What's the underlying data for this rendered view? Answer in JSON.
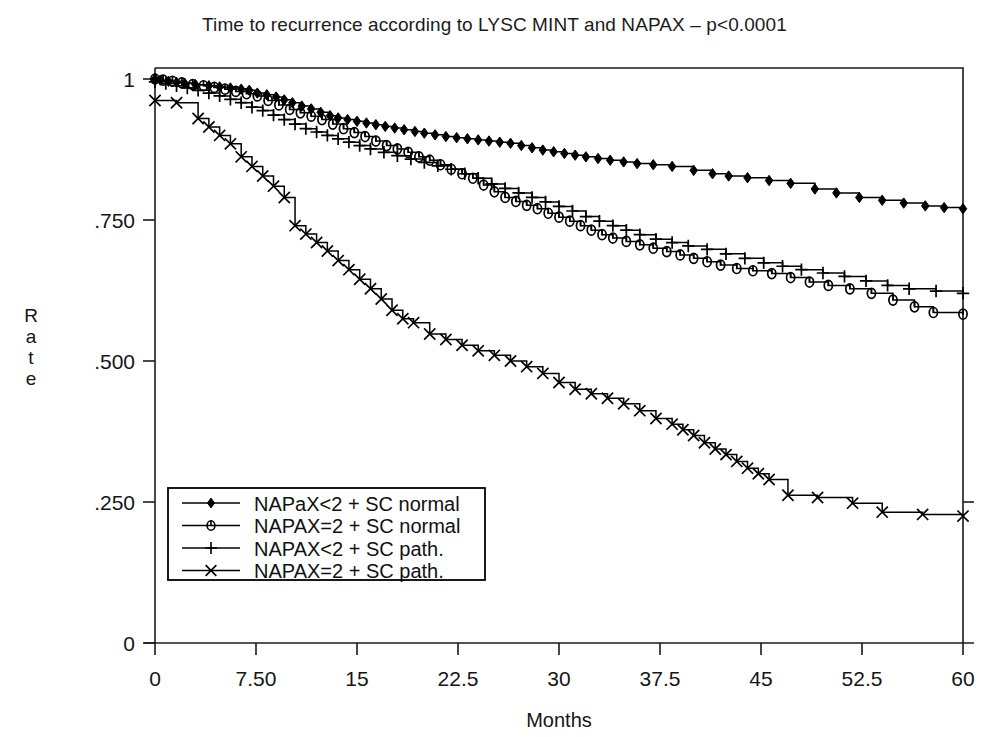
{
  "chart_data": {
    "type": "line",
    "title": "Time to recurrence according to LYSC MINT and NAPAX – p<0.0001",
    "xlabel": "Months",
    "ylabel": "Rate",
    "xlim": [
      0,
      60
    ],
    "ylim": [
      0,
      1
    ],
    "grid": false,
    "legend_position": "lower-left-inside",
    "x_ticks": [
      "0",
      "7.50",
      "15",
      "22.5",
      "30",
      "37.5",
      "45",
      "52.5",
      "60"
    ],
    "x_tick_values": [
      0,
      7.5,
      15,
      22.5,
      30,
      37.5,
      45,
      52.5,
      60
    ],
    "y_ticks": [
      "0",
      ".250",
      ".500",
      ".750",
      "1"
    ],
    "y_tick_values": [
      0,
      0.25,
      0.5,
      0.75,
      1
    ],
    "note": "Kaplan-Meier step curves; markers denote censored observations",
    "series": [
      {
        "name": "NAPaX<2 + SC normal",
        "marker": "filled-diamond",
        "points": [
          [
            0,
            1.0
          ],
          [
            0.4,
            0.998
          ],
          [
            1.0,
            0.996
          ],
          [
            1.6,
            0.994
          ],
          [
            2.2,
            0.992
          ],
          [
            3.0,
            0.99
          ],
          [
            4.0,
            0.988
          ],
          [
            4.8,
            0.986
          ],
          [
            5.6,
            0.984
          ],
          [
            6.4,
            0.982
          ],
          [
            7.0,
            0.98
          ],
          [
            7.6,
            0.975
          ],
          [
            8.3,
            0.972
          ],
          [
            9.0,
            0.968
          ],
          [
            9.6,
            0.963
          ],
          [
            10.2,
            0.958
          ],
          [
            10.9,
            0.952
          ],
          [
            11.6,
            0.947
          ],
          [
            12.3,
            0.941
          ],
          [
            13.0,
            0.935
          ],
          [
            13.6,
            0.931
          ],
          [
            14.3,
            0.928
          ],
          [
            15.0,
            0.925
          ],
          [
            15.7,
            0.922
          ],
          [
            16.4,
            0.919
          ],
          [
            17.1,
            0.916
          ],
          [
            17.8,
            0.913
          ],
          [
            18.5,
            0.91
          ],
          [
            19.3,
            0.907
          ],
          [
            20.0,
            0.904
          ],
          [
            20.8,
            0.901
          ],
          [
            21.6,
            0.898
          ],
          [
            22.4,
            0.896
          ],
          [
            23.2,
            0.894
          ],
          [
            24.0,
            0.892
          ],
          [
            24.8,
            0.89
          ],
          [
            25.6,
            0.888
          ],
          [
            26.4,
            0.886
          ],
          [
            27.2,
            0.882
          ],
          [
            28.0,
            0.878
          ],
          [
            28.8,
            0.874
          ],
          [
            29.6,
            0.871
          ],
          [
            30.4,
            0.868
          ],
          [
            31.2,
            0.865
          ],
          [
            32.0,
            0.862
          ],
          [
            32.9,
            0.859
          ],
          [
            33.8,
            0.856
          ],
          [
            34.8,
            0.853
          ],
          [
            35.8,
            0.85
          ],
          [
            37.0,
            0.848
          ],
          [
            38.4,
            0.845
          ],
          [
            40.0,
            0.838
          ],
          [
            41.4,
            0.832
          ],
          [
            42.6,
            0.828
          ],
          [
            44.0,
            0.825
          ],
          [
            45.6,
            0.82
          ],
          [
            47.2,
            0.815
          ],
          [
            49.0,
            0.805
          ],
          [
            50.6,
            0.798
          ],
          [
            52.3,
            0.79
          ],
          [
            54.0,
            0.785
          ],
          [
            55.6,
            0.78
          ],
          [
            57.2,
            0.775
          ],
          [
            58.6,
            0.772
          ],
          [
            60.0,
            0.77
          ]
        ]
      },
      {
        "name": "NAPAX=2 + SC normal",
        "marker": "circle-bar",
        "points": [
          [
            0,
            1.0
          ],
          [
            0.6,
            0.998
          ],
          [
            1.3,
            0.996
          ],
          [
            2.0,
            0.993
          ],
          [
            2.8,
            0.99
          ],
          [
            3.6,
            0.988
          ],
          [
            4.4,
            0.985
          ],
          [
            5.2,
            0.982
          ],
          [
            6.0,
            0.978
          ],
          [
            6.8,
            0.974
          ],
          [
            7.6,
            0.97
          ],
          [
            8.4,
            0.962
          ],
          [
            9.2,
            0.954
          ],
          [
            10.0,
            0.946
          ],
          [
            10.8,
            0.94
          ],
          [
            11.6,
            0.934
          ],
          [
            12.4,
            0.928
          ],
          [
            13.2,
            0.92
          ],
          [
            14.0,
            0.912
          ],
          [
            14.8,
            0.905
          ],
          [
            15.6,
            0.898
          ],
          [
            16.4,
            0.89
          ],
          [
            17.2,
            0.882
          ],
          [
            18.0,
            0.876
          ],
          [
            18.8,
            0.87
          ],
          [
            19.6,
            0.862
          ],
          [
            20.4,
            0.856
          ],
          [
            21.2,
            0.848
          ],
          [
            22.0,
            0.84
          ],
          [
            22.8,
            0.832
          ],
          [
            23.6,
            0.824
          ],
          [
            24.4,
            0.812
          ],
          [
            25.2,
            0.8
          ],
          [
            26.0,
            0.79
          ],
          [
            26.8,
            0.783
          ],
          [
            27.6,
            0.776
          ],
          [
            28.4,
            0.77
          ],
          [
            29.2,
            0.762
          ],
          [
            30.0,
            0.755
          ],
          [
            30.8,
            0.748
          ],
          [
            31.6,
            0.74
          ],
          [
            32.4,
            0.732
          ],
          [
            33.2,
            0.724
          ],
          [
            34.0,
            0.718
          ],
          [
            35.0,
            0.712
          ],
          [
            36.0,
            0.706
          ],
          [
            37.0,
            0.7
          ],
          [
            38.0,
            0.694
          ],
          [
            39.0,
            0.688
          ],
          [
            40.0,
            0.682
          ],
          [
            41.0,
            0.676
          ],
          [
            42.0,
            0.67
          ],
          [
            43.2,
            0.664
          ],
          [
            44.4,
            0.66
          ],
          [
            45.8,
            0.655
          ],
          [
            47.2,
            0.648
          ],
          [
            48.6,
            0.64
          ],
          [
            50.0,
            0.634
          ],
          [
            51.6,
            0.628
          ],
          [
            53.2,
            0.62
          ],
          [
            54.8,
            0.608
          ],
          [
            56.4,
            0.596
          ],
          [
            57.8,
            0.586
          ],
          [
            60.0,
            0.583
          ]
        ]
      },
      {
        "name": "NAPAX<2 + SC path.",
        "marker": "plus",
        "points": [
          [
            0,
            0.995
          ],
          [
            0.8,
            0.992
          ],
          [
            1.6,
            0.988
          ],
          [
            2.4,
            0.984
          ],
          [
            3.2,
            0.98
          ],
          [
            4.0,
            0.975
          ],
          [
            4.8,
            0.97
          ],
          [
            5.6,
            0.964
          ],
          [
            6.4,
            0.958
          ],
          [
            7.2,
            0.95
          ],
          [
            8.0,
            0.944
          ],
          [
            8.8,
            0.936
          ],
          [
            9.6,
            0.928
          ],
          [
            10.4,
            0.92
          ],
          [
            11.2,
            0.912
          ],
          [
            12.0,
            0.906
          ],
          [
            12.8,
            0.9
          ],
          [
            13.6,
            0.894
          ],
          [
            14.4,
            0.888
          ],
          [
            15.2,
            0.882
          ],
          [
            16.0,
            0.876
          ],
          [
            17.0,
            0.87
          ],
          [
            18.0,
            0.864
          ],
          [
            19.0,
            0.858
          ],
          [
            20.0,
            0.852
          ],
          [
            21.0,
            0.846
          ],
          [
            22.0,
            0.84
          ],
          [
            23.0,
            0.832
          ],
          [
            24.0,
            0.824
          ],
          [
            25.0,
            0.814
          ],
          [
            26.0,
            0.806
          ],
          [
            27.0,
            0.798
          ],
          [
            28.0,
            0.79
          ],
          [
            29.0,
            0.782
          ],
          [
            30.0,
            0.774
          ],
          [
            31.0,
            0.766
          ],
          [
            32.0,
            0.756
          ],
          [
            33.0,
            0.748
          ],
          [
            34.0,
            0.74
          ],
          [
            35.0,
            0.732
          ],
          [
            36.0,
            0.724
          ],
          [
            37.2,
            0.716
          ],
          [
            38.4,
            0.71
          ],
          [
            39.6,
            0.704
          ],
          [
            41.0,
            0.698
          ],
          [
            42.4,
            0.69
          ],
          [
            43.8,
            0.682
          ],
          [
            45.2,
            0.674
          ],
          [
            46.6,
            0.668
          ],
          [
            48.0,
            0.662
          ],
          [
            49.6,
            0.656
          ],
          [
            51.2,
            0.65
          ],
          [
            52.8,
            0.642
          ],
          [
            54.4,
            0.634
          ],
          [
            56.0,
            0.628
          ],
          [
            58.0,
            0.624
          ],
          [
            60.0,
            0.62
          ]
        ]
      },
      {
        "name": "NAPAX=2 + SC path.",
        "marker": "x",
        "points": [
          [
            0,
            0.962
          ],
          [
            1.6,
            0.958
          ],
          [
            3.2,
            0.93
          ],
          [
            4.0,
            0.915
          ],
          [
            4.8,
            0.9
          ],
          [
            5.6,
            0.885
          ],
          [
            6.4,
            0.862
          ],
          [
            7.2,
            0.845
          ],
          [
            8.0,
            0.828
          ],
          [
            8.8,
            0.81
          ],
          [
            9.6,
            0.79
          ],
          [
            10.4,
            0.74
          ],
          [
            11.2,
            0.725
          ],
          [
            12.0,
            0.71
          ],
          [
            12.8,
            0.695
          ],
          [
            13.6,
            0.678
          ],
          [
            14.4,
            0.662
          ],
          [
            15.2,
            0.645
          ],
          [
            16.0,
            0.628
          ],
          [
            16.8,
            0.61
          ],
          [
            17.6,
            0.59
          ],
          [
            18.4,
            0.575
          ],
          [
            19.2,
            0.568
          ],
          [
            20.4,
            0.548
          ],
          [
            21.6,
            0.538
          ],
          [
            22.8,
            0.528
          ],
          [
            24.0,
            0.518
          ],
          [
            25.2,
            0.51
          ],
          [
            26.4,
            0.5
          ],
          [
            27.6,
            0.49
          ],
          [
            28.8,
            0.478
          ],
          [
            30.0,
            0.462
          ],
          [
            31.2,
            0.45
          ],
          [
            32.4,
            0.442
          ],
          [
            33.6,
            0.434
          ],
          [
            34.8,
            0.424
          ],
          [
            36.0,
            0.412
          ],
          [
            37.2,
            0.398
          ],
          [
            38.4,
            0.388
          ],
          [
            39.2,
            0.378
          ],
          [
            40.0,
            0.368
          ],
          [
            40.8,
            0.355
          ],
          [
            41.6,
            0.344
          ],
          [
            42.4,
            0.334
          ],
          [
            43.2,
            0.322
          ],
          [
            44.0,
            0.31
          ],
          [
            44.8,
            0.3
          ],
          [
            45.6,
            0.29
          ],
          [
            47.0,
            0.262
          ],
          [
            49.2,
            0.258
          ],
          [
            51.8,
            0.248
          ],
          [
            54.0,
            0.232
          ],
          [
            57.0,
            0.228
          ],
          [
            60.0,
            0.225
          ]
        ]
      }
    ],
    "legend": [
      {
        "label": "NAPaX<2 + SC normal",
        "marker": "filled-diamond"
      },
      {
        "label": "NAPAX=2 + SC normal",
        "marker": "circle-bar"
      },
      {
        "label": "NAPAX<2 + SC path.",
        "marker": "plus"
      },
      {
        "label": "NAPAX=2 + SC path.",
        "marker": "x"
      }
    ],
    "colors": {
      "line": "#000000",
      "axis": "#1a1a1a",
      "background": "#ffffff"
    }
  }
}
